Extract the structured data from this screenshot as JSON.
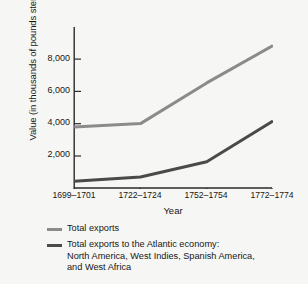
{
  "chart_data": {
    "type": "line",
    "title": "",
    "xlabel": "Year",
    "ylabel": "Value (in thousands of pounds sterling)",
    "categories": [
      "1699–1701",
      "1722–1724",
      "1752–1754",
      "1772–1774"
    ],
    "yticks": [
      "2,000",
      "4,000",
      "6,000",
      "8,000"
    ],
    "ytick_values": [
      2000,
      4000,
      6000,
      8000
    ],
    "ylim": [
      0,
      9500
    ],
    "grid": false,
    "legend_position": "below",
    "series": [
      {
        "name": "Total exports",
        "color": "#8b8b8b",
        "values": [
          3600,
          3800,
          6200,
          8400
        ]
      },
      {
        "name": "Total exports to the Atlantic economy: North America, West Indies, Spanish America, and West Africa",
        "color": "#4a4a4a",
        "values": [
          400,
          650,
          1550,
          3950
        ]
      }
    ]
  },
  "legend": {
    "items": [
      {
        "label": "Total exports",
        "line2": "",
        "line3": ""
      },
      {
        "label": "Total exports to the Atlantic economy:",
        "line2": "North America, West Indies, Spanish America,",
        "line3": "and West Africa"
      }
    ]
  },
  "colors": {
    "total_exports": "#8b8b8b",
    "atlantic_exports": "#4a4a4a",
    "axis": "#2b2b2b",
    "background": "#f6f6f4"
  }
}
